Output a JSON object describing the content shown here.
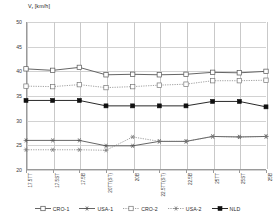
{
  "chart_data": {
    "type": "line",
    "title_main": "V",
    "title_sub": "r",
    "title_unit": " [km/h]",
    "xlabel": "",
    "ylabel": "Vᵣ [km/h]",
    "ylim": [
      20,
      50
    ],
    "ytick_step": 5,
    "yticks": [
      50,
      45,
      40,
      35,
      30,
      25,
      20
    ],
    "grid": true,
    "legend_position": "bottom",
    "categories": [
      "17.5TT",
      "17.5ST",
      "17.5B",
      "20TT(ST)",
      "20B",
      "22.5TT(ST)",
      "22.5B",
      "25TT",
      "25ST",
      "25B"
    ],
    "series": [
      {
        "name": "CRO-1",
        "values": [
          40.5,
          40.2,
          40.8,
          39.3,
          39.4,
          39.3,
          39.4,
          39.8,
          39.7,
          40.0
        ],
        "line": "solid",
        "marker": "open-square",
        "color": "#555555"
      },
      {
        "name": "USA-1",
        "values": [
          26.0,
          26.0,
          26.0,
          24.9,
          24.9,
          25.8,
          25.8,
          26.8,
          26.7,
          26.8
        ],
        "line": "solid",
        "marker": "star",
        "color": "#555555"
      },
      {
        "name": "CRO-2",
        "values": [
          37.0,
          36.9,
          37.3,
          36.7,
          36.9,
          37.2,
          37.4,
          38.1,
          38.1,
          38.2
        ],
        "line": "dotted",
        "marker": "open-square",
        "color": "#777777"
      },
      {
        "name": "USA-2",
        "values": [
          24.1,
          24.1,
          24.1,
          24.0,
          26.7,
          25.8,
          25.8,
          26.8,
          26.7,
          26.8
        ],
        "line": "dotted",
        "marker": "star",
        "color": "#777777"
      },
      {
        "name": "NLD",
        "values": [
          34.1,
          34.1,
          34.1,
          33.0,
          33.0,
          33.0,
          33.0,
          33.9,
          33.9,
          32.8
        ],
        "line": "solid",
        "marker": "filled-square",
        "color": "#111111"
      }
    ]
  }
}
